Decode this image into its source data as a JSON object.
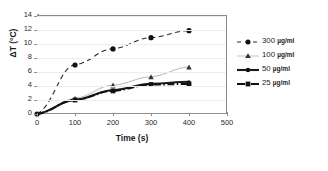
{
  "chart_data": {
    "type": "line",
    "title": "",
    "subtitle": "",
    "xlabel": "Time (s)",
    "ylabel": "ΔT (°C)",
    "xlim": [
      0,
      500
    ],
    "ylim": [
      0,
      14
    ],
    "xticks": [
      0,
      100,
      200,
      300,
      400,
      500
    ],
    "yticks": [
      0,
      2,
      4,
      6,
      8,
      10,
      12,
      14
    ],
    "grid": "horizontal",
    "legend_position": "right-outside",
    "x": [
      0,
      100,
      200,
      300,
      400
    ],
    "series": [
      {
        "name": "300 µg/ml",
        "concentration": "300",
        "unit": "µg/ml",
        "values": [
          0,
          7.0,
          9.3,
          10.9,
          11.9
        ],
        "marker": "circle",
        "linestyle": "dashed",
        "color": "#2b2b2b"
      },
      {
        "name": "100 µg/ml",
        "concentration": "100",
        "unit": "µg/ml",
        "values": [
          0,
          2.2,
          4.1,
          5.3,
          6.7
        ],
        "marker": "triangle",
        "linestyle": "solid",
        "color": "#b8b8b8"
      },
      {
        "name": "50 µg/ml",
        "concentration": "50",
        "unit": "µg/ml",
        "values": [
          0,
          2.0,
          3.4,
          4.3,
          4.6
        ],
        "marker": "small-circle",
        "linestyle": "solid",
        "color": "#1a1a1a"
      },
      {
        "name": "25 µg/ml",
        "concentration": "25",
        "unit": "µg/ml",
        "values": [
          0,
          2.0,
          3.3,
          4.2,
          4.3
        ],
        "marker": "square",
        "linestyle": "dash-dot",
        "color": "#111111"
      }
    ]
  },
  "axes": {
    "ylabel": "ΔT (°C)",
    "xlabel": "Time (s)",
    "ytick_labels": [
      "14",
      "12",
      "10",
      "8",
      "6",
      "4",
      "2",
      "0"
    ],
    "xtick_labels": [
      "0",
      "100",
      "200",
      "300",
      "400",
      "500"
    ]
  },
  "legend": {
    "items": [
      {
        "concentration": "300",
        "unit": "µg/ml",
        "label": "300 µg/ml",
        "icon": "dashed-circle-marker-icon"
      },
      {
        "concentration": "100",
        "unit": "µg/ml",
        "label": "100 µg/ml",
        "icon": "triangle-marker-icon"
      },
      {
        "concentration": "50",
        "unit": "µg/ml",
        "label": "50 µg/ml",
        "icon": "solid-circle-marker-icon"
      },
      {
        "concentration": "25",
        "unit": "µg/ml",
        "label": "25 µg/ml",
        "icon": "dashdot-square-marker-icon"
      }
    ]
  },
  "colors": {
    "axis": "#8f8f8f",
    "grid": "#ededed",
    "text": "#1a1a1a",
    "series_300": "#2b2b2b",
    "series_100": "#b8b8b8",
    "series_50": "#1a1a1a",
    "series_25": "#111111"
  }
}
